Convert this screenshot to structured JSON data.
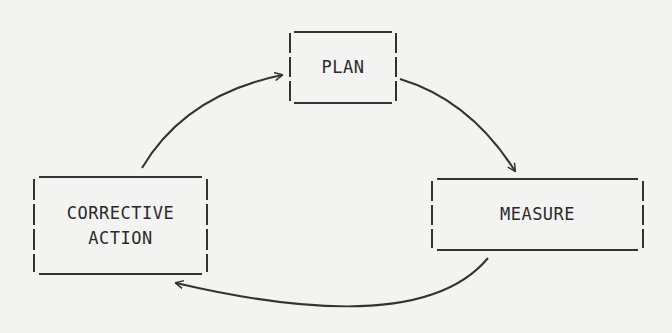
{
  "diagram": {
    "type": "cycle",
    "nodes": [
      {
        "id": "plan",
        "label_lines": [
          "PLAN"
        ]
      },
      {
        "id": "measure",
        "label_lines": [
          "MEASURE"
        ]
      },
      {
        "id": "corrective_action",
        "label_lines": [
          "CORRECTIVE",
          "ACTION"
        ]
      }
    ],
    "edges": [
      {
        "from": "corrective_action",
        "to": "plan"
      },
      {
        "from": "plan",
        "to": "measure"
      },
      {
        "from": "measure",
        "to": "corrective_action"
      }
    ]
  },
  "colors": {
    "background": "#f3f3f1",
    "line": "#333333",
    "text": "#2a2a2a"
  }
}
